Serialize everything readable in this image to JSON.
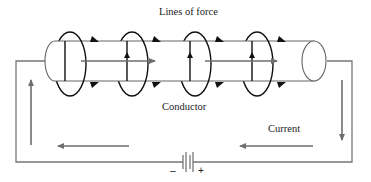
{
  "diagram": {
    "type": "electromagnetism",
    "labels": {
      "lines_of_force": "Lines of force",
      "conductor": "Conductor",
      "current": "Current",
      "battery_negative": "–",
      "battery_positive": "+"
    },
    "colors": {
      "wire": "#666666",
      "loop": "#111111",
      "arrow": "#666666",
      "text": "#222222"
    },
    "components": [
      "conductor-cylinder",
      "field-loops",
      "circuit-wire",
      "battery",
      "current-arrows"
    ],
    "field_loop_count": 4
  }
}
